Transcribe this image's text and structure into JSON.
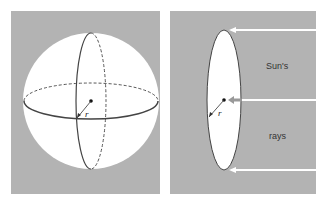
{
  "figure": {
    "background_color": "#b3b3b3",
    "sphere_color": "#ffffff",
    "line_color": "#444444",
    "left_panel": {
      "description": "sphere with great circles",
      "radius_label": "r"
    },
    "right_panel": {
      "description": "disk cross-section facing the Sun",
      "radius_label": "r",
      "ray_label_top": "Sun's",
      "ray_label_bottom": "rays"
    }
  }
}
